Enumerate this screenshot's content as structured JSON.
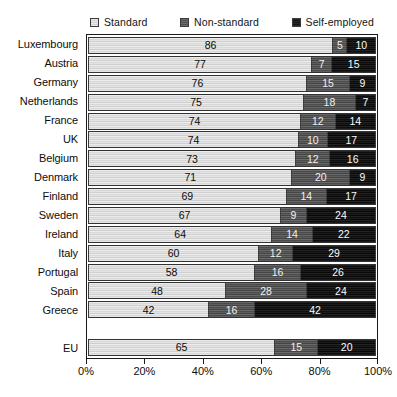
{
  "legend": {
    "entries": [
      {
        "label": "Standard",
        "icon": "legend-swatch-standard",
        "color": "#dcdcdc"
      },
      {
        "label": "Non-standard",
        "icon": "legend-swatch-non-standard",
        "color": "#575757"
      },
      {
        "label": "Self-employed",
        "icon": "legend-swatch-self-employed",
        "color": "#141414"
      }
    ]
  },
  "axis": {
    "tick_labels": [
      "0%",
      "20%",
      "40%",
      "60%",
      "80%",
      "100%"
    ],
    "tick_values": [
      0,
      20,
      40,
      60,
      80,
      100
    ]
  },
  "chart_data": {
    "type": "bar",
    "orientation": "horizontal",
    "stacked": true,
    "stack_total": 100,
    "title": "",
    "subtitle": "",
    "xlabel": "",
    "ylabel": "",
    "xlim": [
      0,
      100
    ],
    "grid": false,
    "legend_position": "top",
    "categories": [
      "Luxembourg",
      "Austria",
      "Germany",
      "Netherlands",
      "France",
      "UK",
      "Belgium",
      "Denmark",
      "Finland",
      "Sweden",
      "Ireland",
      "Italy",
      "Portugal",
      "Spain",
      "Greece",
      "",
      "EU"
    ],
    "series": [
      {
        "name": "Standard",
        "color": "#dcdcdc",
        "values": [
          86,
          77,
          76,
          75,
          74,
          74,
          73,
          71,
          69,
          67,
          64,
          60,
          58,
          48,
          42,
          null,
          65
        ]
      },
      {
        "name": "Non-standard",
        "color": "#575757",
        "values": [
          5,
          7,
          15,
          18,
          12,
          10,
          12,
          20,
          14,
          9,
          14,
          12,
          16,
          28,
          16,
          null,
          15
        ]
      },
      {
        "name": "Self-employed",
        "color": "#141414",
        "values": [
          10,
          15,
          9,
          7,
          14,
          17,
          16,
          9,
          17,
          24,
          22,
          29,
          26,
          24,
          42,
          null,
          20
        ]
      }
    ],
    "rows": [
      {
        "category": "Luxembourg",
        "standard": 86,
        "non_standard": 5,
        "self_employed": 10
      },
      {
        "category": "Austria",
        "standard": 77,
        "non_standard": 7,
        "self_employed": 15
      },
      {
        "category": "Germany",
        "standard": 76,
        "non_standard": 15,
        "self_employed": 9
      },
      {
        "category": "Netherlands",
        "standard": 75,
        "non_standard": 18,
        "self_employed": 7
      },
      {
        "category": "France",
        "standard": 74,
        "non_standard": 12,
        "self_employed": 14
      },
      {
        "category": "UK",
        "standard": 74,
        "non_standard": 10,
        "self_employed": 17
      },
      {
        "category": "Belgium",
        "standard": 73,
        "non_standard": 12,
        "self_employed": 16
      },
      {
        "category": "Denmark",
        "standard": 71,
        "non_standard": 20,
        "self_employed": 9
      },
      {
        "category": "Finland",
        "standard": 69,
        "non_standard": 14,
        "self_employed": 17
      },
      {
        "category": "Sweden",
        "standard": 67,
        "non_standard": 9,
        "self_employed": 24
      },
      {
        "category": "Ireland",
        "standard": 64,
        "non_standard": 14,
        "self_employed": 22
      },
      {
        "category": "Italy",
        "standard": 60,
        "non_standard": 12,
        "self_employed": 29
      },
      {
        "category": "Portugal",
        "standard": 58,
        "non_standard": 16,
        "self_employed": 26
      },
      {
        "category": "Spain",
        "standard": 48,
        "non_standard": 28,
        "self_employed": 24
      },
      {
        "category": "Greece",
        "standard": 42,
        "non_standard": 16,
        "self_employed": 42
      },
      {
        "category": "",
        "standard": null,
        "non_standard": null,
        "self_employed": null
      },
      {
        "category": "EU",
        "standard": 65,
        "non_standard": 15,
        "self_employed": 20
      }
    ]
  }
}
